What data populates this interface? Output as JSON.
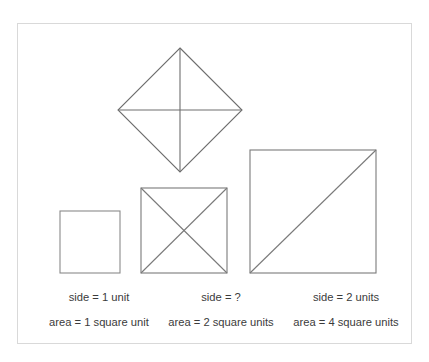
{
  "figure": {
    "stroke_color": "#6e6e6e",
    "frame_color": "#d9d9d9",
    "text_color": "#3b3b3b",
    "background": "#ffffff"
  },
  "shapes": {
    "diamond": {
      "name": "rotated-square-four-triangles",
      "top": {
        "x": 180,
        "y": 48
      },
      "right": {
        "x": 242,
        "y": 110
      },
      "bottom": {
        "x": 180,
        "y": 172
      },
      "left": {
        "x": 118,
        "y": 110
      },
      "divisions": 4,
      "division_style": "vertical-and-horizontal-median"
    },
    "small_square": {
      "name": "unit-square",
      "x": 60,
      "y": 211,
      "width": 60,
      "height": 62,
      "diagonals": 0
    },
    "middle_square": {
      "name": "square-with-x-diagonals",
      "x": 141,
      "y": 188,
      "width": 86,
      "height": 85,
      "diagonals": 2
    },
    "large_square": {
      "name": "square-with-one-diagonal",
      "x": 250,
      "y": 150,
      "width": 126,
      "height": 123,
      "diagonals": 1
    }
  },
  "captions": {
    "columns": [
      {
        "id": "small",
        "side": "side = 1 unit",
        "area": "area = 1 square unit"
      },
      {
        "id": "middle",
        "side": "side = ?",
        "area": "area = 2 square units"
      },
      {
        "id": "large",
        "side": "side = 2 units",
        "area": "area = 4 square units"
      }
    ]
  }
}
